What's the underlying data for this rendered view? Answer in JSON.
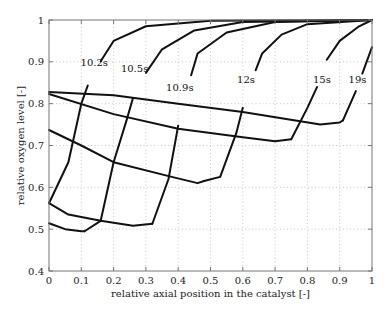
{
  "chart_data": {
    "type": "line",
    "title": "",
    "xlabel": "relative axial position in the catalyst [-]",
    "ylabel": "relative oxygen level [-]",
    "xlim": [
      0,
      1
    ],
    "ylim": [
      0.4,
      1
    ],
    "xticks": [
      0,
      0.1,
      0.2,
      0.3,
      0.4,
      0.5,
      0.6,
      0.7,
      0.8,
      0.9,
      1
    ],
    "xtick_labels": [
      "0",
      "0.1",
      "0.2",
      "0.3",
      "0.4",
      "0.5",
      "0.6",
      "0.7",
      "0.8",
      "0.9",
      "1"
    ],
    "yticks": [
      0.4,
      0.5,
      0.6,
      0.7,
      0.8,
      0.9,
      1
    ],
    "ytick_labels": [
      "0.4",
      "0.5",
      "0.6",
      "0.7",
      "0.8",
      "0.9",
      "1"
    ],
    "grid": true,
    "legend": null,
    "series": [
      {
        "name": "10.2s",
        "role": "time-profile",
        "label_pos": [
          0.14,
          0.9
        ],
        "points": [
          [
            0,
            0.562
          ],
          [
            0.06,
            0.66
          ],
          [
            0.1,
            0.8
          ],
          [
            0.13,
            0.865
          ],
          [
            0.2,
            0.95
          ],
          [
            0.3,
            0.985
          ],
          [
            0.5,
            0.998
          ],
          [
            1,
            1
          ]
        ],
        "label_gap": [
          0.12,
          0.16
        ]
      },
      {
        "name": "10.5s",
        "role": "time-profile",
        "label_pos": [
          0.265,
          0.885
        ],
        "points": [
          [
            0.11,
            0.495
          ],
          [
            0.16,
            0.52
          ],
          [
            0.2,
            0.66
          ],
          [
            0.24,
            0.76
          ],
          [
            0.27,
            0.84
          ],
          [
            0.35,
            0.93
          ],
          [
            0.45,
            0.975
          ],
          [
            0.6,
            0.995
          ],
          [
            1,
            1
          ]
        ],
        "label_gap": [
          0.26,
          0.3
        ]
      },
      {
        "name": "10.9s",
        "role": "time-profile",
        "label_pos": [
          0.405,
          0.84
        ],
        "points": [
          [
            0.32,
            0.513
          ],
          [
            0.37,
            0.62
          ],
          [
            0.41,
            0.79
          ],
          [
            0.46,
            0.92
          ],
          [
            0.55,
            0.97
          ],
          [
            0.7,
            0.995
          ],
          [
            1,
            1
          ]
        ],
        "label_gap": [
          0.4,
          0.44
        ]
      },
      {
        "name": "12s",
        "role": "time-profile",
        "label_pos": [
          0.61,
          0.86
        ],
        "points": [
          [
            0.48,
            0.615
          ],
          [
            0.53,
            0.625
          ],
          [
            0.58,
            0.73
          ],
          [
            0.61,
            0.82
          ],
          [
            0.66,
            0.92
          ],
          [
            0.72,
            0.965
          ],
          [
            0.8,
            0.99
          ],
          [
            1,
            1
          ]
        ],
        "label_gap": [
          0.6,
          0.64
        ]
      },
      {
        "name": "15s",
        "role": "time-profile",
        "label_pos": [
          0.845,
          0.86
        ],
        "points": [
          [
            0.75,
            0.715
          ],
          [
            0.8,
            0.79
          ],
          [
            0.83,
            0.84
          ],
          [
            0.86,
            0.905
          ],
          [
            0.9,
            0.95
          ],
          [
            0.96,
            0.985
          ],
          [
            1,
            1
          ]
        ],
        "label_gap": [
          0.83,
          0.86
        ]
      },
      {
        "name": "19s",
        "role": "time-profile",
        "label_pos": [
          0.955,
          0.86
        ],
        "points": [
          [
            0.91,
            0.76
          ],
          [
            0.95,
            0.83
          ],
          [
            1,
            0.935
          ]
        ],
        "label_gap": [
          0.95,
          0.97
        ]
      },
      {
        "name": "axial-A",
        "role": "axial-profile",
        "points": [
          [
            0,
            0.828
          ],
          [
            0.2,
            0.82
          ],
          [
            0.4,
            0.8
          ],
          [
            0.6,
            0.78
          ],
          [
            0.84,
            0.75
          ],
          [
            0.9,
            0.755
          ],
          [
            0.91,
            0.76
          ]
        ]
      },
      {
        "name": "axial-B",
        "role": "axial-profile",
        "points": [
          [
            0,
            0.823
          ],
          [
            0.2,
            0.775
          ],
          [
            0.4,
            0.74
          ],
          [
            0.6,
            0.72
          ],
          [
            0.7,
            0.71
          ],
          [
            0.75,
            0.715
          ]
        ]
      },
      {
        "name": "axial-C",
        "role": "axial-profile",
        "points": [
          [
            0,
            0.737
          ],
          [
            0.1,
            0.7
          ],
          [
            0.2,
            0.66
          ],
          [
            0.38,
            0.625
          ],
          [
            0.46,
            0.61
          ],
          [
            0.48,
            0.615
          ]
        ]
      },
      {
        "name": "axial-D",
        "role": "axial-profile",
        "points": [
          [
            0,
            0.562
          ],
          [
            0.06,
            0.535
          ],
          [
            0.16,
            0.52
          ],
          [
            0.26,
            0.508
          ],
          [
            0.32,
            0.513
          ]
        ]
      },
      {
        "name": "axial-E",
        "role": "axial-profile",
        "points": [
          [
            0,
            0.514
          ],
          [
            0.05,
            0.5
          ],
          [
            0.1,
            0.495
          ],
          [
            0.11,
            0.495
          ]
        ]
      }
    ],
    "annotations": [
      "10.2s",
      "10.5s",
      "10.9s",
      "12s",
      "15s",
      "19s"
    ]
  },
  "layout": {
    "plot": {
      "left": 49,
      "top": 20,
      "right": 372,
      "bottom": 271
    },
    "line_color": "#111111",
    "grid_color": "#bdbdbd",
    "frame_color": "#777777"
  }
}
